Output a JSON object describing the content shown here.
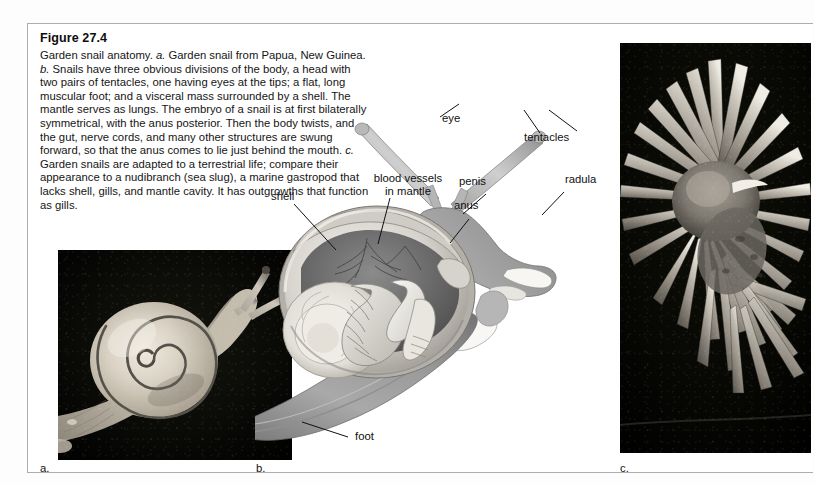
{
  "figure": {
    "title": "Figure 27.4",
    "caption_plain": "Garden snail anatomy. a. Garden snail from Papua, New Guinea. b. Snails have three obvious divisions of the body, a head with two pairs of tentacles, one having eyes at the tips; a flat, long muscular foot; and a visceral mass surrounded by a shell. The mantle serves as lungs. The embryo of a snail is at first bilaterally symmetrical, with the anus posterior. Then the body twists, and the gut, nerve cords, and many other structures are swung forward, so that the anus comes to lie just behind the mouth. c. Garden snails are adapted to a terrestrial life; compare their appearance to a nudibranch (sea slug), a marine gastropod that lacks shell, gills, and mantle cavity. It has outgrowths that function as gills."
  },
  "panels": {
    "a": {
      "letter": "a.",
      "subject": "garden-snail-photograph"
    },
    "b": {
      "letter": "b.",
      "subject": "snail-anatomy-illustration"
    },
    "c": {
      "letter": "c.",
      "subject": "nudibranch-photograph"
    }
  },
  "callouts": {
    "eye": "eye",
    "tentacles": "tentacles",
    "blood_vessels": "blood vessels\nin mantle",
    "blood_vessels_line1": "blood vessels",
    "blood_vessels_line2": "in mantle",
    "penis": "penis",
    "radula": "radula",
    "shell": "shell",
    "anus": "anus",
    "foot": "foot"
  },
  "colors": {
    "frame_border": "#adadad",
    "text": "#111111",
    "leader_line": "#111111",
    "photo_background": "#060606",
    "illustration_mid": "#9a9a9a",
    "illustration_light": "#e8e6e2",
    "illustration_dark": "#4a4a4a"
  }
}
